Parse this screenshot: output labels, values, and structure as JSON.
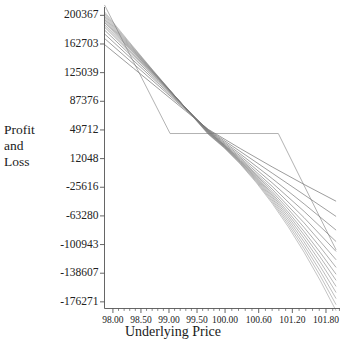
{
  "chart_data": {
    "type": "line",
    "title": "",
    "xlabel": "Underlying Price",
    "ylabel": "Profit and Loss",
    "ylabel_lines": [
      "Profit",
      "and",
      "Loss"
    ],
    "grid": false,
    "legend": "none",
    "xlim": [
      97.85,
      102.05
    ],
    "ylim": [
      -185000,
      210000
    ],
    "xticks": [
      "98.00",
      "98.50",
      "99.00",
      "99.50",
      "100.00",
      "100.60",
      "101.20",
      "101.80"
    ],
    "xtick_values": [
      98.0,
      98.5,
      99.0,
      99.5,
      100.0,
      100.6,
      101.2,
      101.8
    ],
    "yticks": [
      "200367",
      "162703",
      "125039",
      "87376",
      "49712",
      "12048",
      "-25616",
      "-63280",
      "-100943",
      "-138607",
      "-176271"
    ],
    "ytick_values": [
      200367,
      162703,
      125039,
      87376,
      49712,
      12048,
      -25616,
      -63280,
      -100943,
      -138607,
      -176271
    ],
    "minor_xticks_per_interval": 5,
    "line_color": "#777777",
    "expiry_line_color": "#999999",
    "axis_color": "#555555",
    "series": [
      {
        "name": "expiry-payoff",
        "style": "piecewise-linear",
        "x": [
          97.85,
          99.02,
          100.95,
          101.98
        ],
        "values": [
          214000,
          45000,
          45000,
          -108000
        ]
      },
      {
        "name": "decay-curve-1",
        "x": [
          97.85,
          99.7,
          101.98
        ],
        "values": [
          205000,
          44000,
          -188000
        ]
      },
      {
        "name": "decay-curve-2",
        "x": [
          97.85,
          99.7,
          101.98
        ],
        "values": [
          203000,
          44500,
          -180000
        ]
      },
      {
        "name": "decay-curve-3",
        "x": [
          97.85,
          99.7,
          101.98
        ],
        "values": [
          201000,
          45000,
          -172000
        ]
      },
      {
        "name": "decay-curve-4",
        "x": [
          97.85,
          99.7,
          101.98
        ],
        "values": [
          199000,
          45500,
          -164000
        ]
      },
      {
        "name": "decay-curve-5",
        "x": [
          97.85,
          99.7,
          101.98
        ],
        "values": [
          197000,
          46000,
          -156000
        ]
      },
      {
        "name": "decay-curve-6",
        "x": [
          97.85,
          99.7,
          101.98
        ],
        "values": [
          195000,
          46500,
          -148000
        ]
      },
      {
        "name": "decay-curve-7",
        "x": [
          97.85,
          99.7,
          101.98
        ],
        "values": [
          193000,
          47000,
          -140000
        ]
      },
      {
        "name": "decay-curve-8",
        "x": [
          97.85,
          99.7,
          101.98
        ],
        "values": [
          191000,
          47500,
          -131000
        ]
      },
      {
        "name": "decay-curve-9",
        "x": [
          97.85,
          99.7,
          101.98
        ],
        "values": [
          188000,
          48000,
          -121000
        ]
      },
      {
        "name": "decay-curve-10",
        "x": [
          97.85,
          99.7,
          101.98
        ],
        "values": [
          185000,
          48500,
          -110000
        ]
      },
      {
        "name": "decay-curve-11",
        "x": [
          97.85,
          99.7,
          101.98
        ],
        "values": [
          181000,
          49000,
          -97000
        ]
      },
      {
        "name": "decay-curve-12",
        "x": [
          97.85,
          99.7,
          101.98
        ],
        "values": [
          176000,
          49500,
          -82000
        ]
      },
      {
        "name": "decay-curve-13",
        "x": [
          97.85,
          99.7,
          101.98
        ],
        "values": [
          170000,
          50000,
          -64000
        ]
      },
      {
        "name": "decay-curve-14",
        "x": [
          97.85,
          99.7,
          101.98
        ],
        "values": [
          162000,
          50500,
          -44000
        ]
      }
    ]
  },
  "axes": {
    "x_axis_name": "underlying-price-axis",
    "y_axis_name": "profit-and-loss-axis"
  }
}
